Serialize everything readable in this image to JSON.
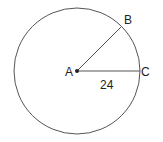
{
  "diagram": {
    "type": "circle-radius",
    "colors": {
      "stroke": "#555555",
      "text": "#222222",
      "background": "#ffffff"
    },
    "circle": {
      "cx": 77,
      "cy": 71,
      "r": 63
    },
    "center": {
      "label": "A",
      "x": 77,
      "y": 71
    },
    "points": [
      {
        "label": "B",
        "x": 121,
        "y": 26
      },
      {
        "label": "C",
        "x": 140,
        "y": 71
      }
    ],
    "segments": [
      {
        "from": "A",
        "to": "B"
      },
      {
        "from": "A",
        "to": "C",
        "length_label": "24"
      }
    ]
  }
}
